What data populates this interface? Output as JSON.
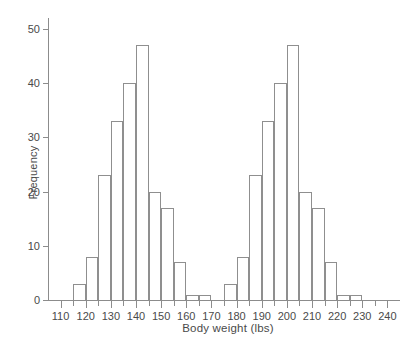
{
  "chart_data": {
    "type": "bar",
    "title": "",
    "subtitle": "",
    "xlabel": "Body weight (lbs)",
    "ylabel": "Frequency",
    "grid": false,
    "legend": null,
    "xlim": [
      105,
      245
    ],
    "ylim": [
      0,
      52
    ],
    "bin_width": 5,
    "x_major_ticks": [
      110,
      120,
      130,
      140,
      150,
      160,
      170,
      180,
      190,
      200,
      210,
      220,
      230,
      240
    ],
    "x_major_tick_labels": [
      "110",
      "120",
      "130",
      "140",
      "150",
      "160",
      "170",
      "180",
      "190",
      "200",
      "210",
      "220",
      "230",
      "240"
    ],
    "x_minor_ticks": [
      115,
      125,
      135,
      145,
      155,
      165,
      175,
      185,
      195,
      205,
      215,
      225,
      235
    ],
    "y_ticks": [
      0,
      10,
      20,
      30,
      40,
      50
    ],
    "y_tick_labels": [
      "0",
      "10",
      "20",
      "30",
      "40",
      "50"
    ],
    "bin_edges": [
      115,
      120,
      125,
      130,
      135,
      140,
      145,
      150,
      155,
      160,
      165,
      170,
      175,
      180,
      185,
      190,
      195,
      200,
      205,
      210,
      215,
      220,
      225,
      230
    ],
    "categories": [
      "115-120",
      "120-125",
      "125-130",
      "130-135",
      "135-140",
      "140-145",
      "145-150",
      "150-155",
      "155-160",
      "160-165",
      "165-170",
      "170-175",
      "175-180",
      "180-185",
      "185-190",
      "190-195",
      "195-200",
      "200-205",
      "205-210",
      "210-215",
      "215-220",
      "220-225",
      "225-230"
    ],
    "values": [
      3,
      8,
      23,
      33,
      40,
      47,
      20,
      17,
      7,
      1,
      1,
      0,
      3,
      8,
      23,
      33,
      40,
      47,
      20,
      17,
      7,
      1,
      1
    ],
    "bars": [
      {
        "x0": 115,
        "x1": 120,
        "value": 3
      },
      {
        "x0": 120,
        "x1": 125,
        "value": 8
      },
      {
        "x0": 125,
        "x1": 130,
        "value": 23
      },
      {
        "x0": 130,
        "x1": 135,
        "value": 33
      },
      {
        "x0": 135,
        "x1": 140,
        "value": 40
      },
      {
        "x0": 140,
        "x1": 145,
        "value": 47
      },
      {
        "x0": 145,
        "x1": 150,
        "value": 20
      },
      {
        "x0": 150,
        "x1": 155,
        "value": 17
      },
      {
        "x0": 155,
        "x1": 160,
        "value": 7
      },
      {
        "x0": 160,
        "x1": 165,
        "value": 1
      },
      {
        "x0": 165,
        "x1": 170,
        "value": 1
      },
      {
        "x0": 175,
        "x1": 180,
        "value": 3
      },
      {
        "x0": 180,
        "x1": 185,
        "value": 8
      },
      {
        "x0": 185,
        "x1": 190,
        "value": 23
      },
      {
        "x0": 190,
        "x1": 195,
        "value": 33
      },
      {
        "x0": 195,
        "x1": 200,
        "value": 40
      },
      {
        "x0": 200,
        "x1": 205,
        "value": 47
      },
      {
        "x0": 205,
        "x1": 210,
        "value": 20
      },
      {
        "x0": 210,
        "x1": 215,
        "value": 17
      },
      {
        "x0": 215,
        "x1": 220,
        "value": 7
      },
      {
        "x0": 220,
        "x1": 225,
        "value": 1
      },
      {
        "x0": 225,
        "x1": 230,
        "value": 1
      }
    ],
    "colors": {
      "bar_stroke": "#8f8f8f",
      "bar_fill": "transparent",
      "axis": "#8c8c8c",
      "text": "#4a4a4a",
      "background": "#ffffff"
    }
  }
}
